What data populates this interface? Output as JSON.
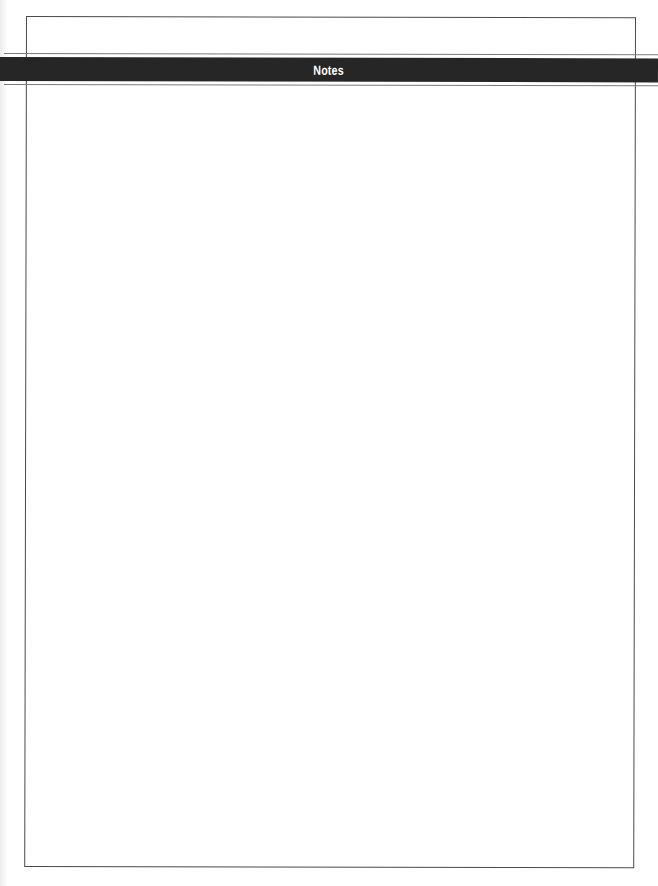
{
  "page": {
    "header": {
      "title": "Notes"
    },
    "notes_area": {
      "content": ""
    },
    "colors": {
      "banner_background": "#262626",
      "banner_text": "#ffffff",
      "frame_border": "#4a4a4a",
      "rules": "#7a7a7a",
      "page_background": "#ffffff"
    }
  }
}
